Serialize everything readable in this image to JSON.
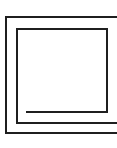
{
  "figure": {
    "name": "square-spiral-glyph",
    "stroke_color": "#1f1f1f",
    "background": "#ffffff",
    "stroke_width": 2,
    "paths": [
      {
        "name": "outer-stroke",
        "d": "M117 17 L6 17 L6 133 L117 133"
      },
      {
        "name": "middle-stroke",
        "d": "M27 112 L107 112 L107 29 L17 29 L17 123 L117 123"
      }
    ]
  }
}
